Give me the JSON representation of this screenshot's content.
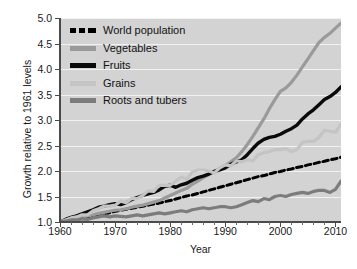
{
  "chart_data": {
    "type": "line",
    "title": "",
    "xlabel": "Year",
    "ylabel": "Growth relative to 1961 levels",
    "xlim": [
      1960,
      2011
    ],
    "ylim": [
      1.0,
      5.0
    ],
    "grid": true,
    "legend_position": "top-left",
    "xticks": [
      1960,
      1970,
      1980,
      1990,
      2000,
      2010
    ],
    "xtick_labels": [
      "1960",
      "1970",
      "1980",
      "1990",
      "2000",
      "2010"
    ],
    "yticks": [
      1.0,
      1.5,
      2.0,
      2.5,
      3.0,
      3.5,
      4.0,
      4.5,
      5.0
    ],
    "ytick_labels": [
      "1.0",
      "1.5",
      "2.0",
      "2.5",
      "3.0",
      "3.5",
      "4.0",
      "4.5",
      "5.0"
    ],
    "x": [
      1960,
      1961,
      1962,
      1963,
      1964,
      1965,
      1966,
      1967,
      1968,
      1969,
      1970,
      1971,
      1972,
      1973,
      1974,
      1975,
      1976,
      1977,
      1978,
      1979,
      1980,
      1981,
      1982,
      1983,
      1984,
      1985,
      1986,
      1987,
      1988,
      1989,
      1990,
      1991,
      1992,
      1993,
      1994,
      1995,
      1996,
      1997,
      1998,
      1999,
      2000,
      2001,
      2002,
      2003,
      2004,
      2005,
      2006,
      2007,
      2008,
      2009,
      2010,
      2011
    ],
    "series": [
      {
        "name": "World population",
        "color": "#000000",
        "style": "dashed",
        "width": 3.0,
        "values": [
          1.0,
          1.02,
          1.04,
          1.06,
          1.08,
          1.1,
          1.12,
          1.14,
          1.16,
          1.18,
          1.21,
          1.23,
          1.25,
          1.27,
          1.29,
          1.31,
          1.33,
          1.35,
          1.37,
          1.4,
          1.42,
          1.45,
          1.48,
          1.51,
          1.53,
          1.56,
          1.59,
          1.62,
          1.65,
          1.68,
          1.71,
          1.74,
          1.77,
          1.8,
          1.83,
          1.86,
          1.89,
          1.91,
          1.94,
          1.97,
          1.99,
          2.02,
          2.04,
          2.07,
          2.09,
          2.12,
          2.14,
          2.17,
          2.19,
          2.22,
          2.24,
          2.27
        ]
      },
      {
        "name": "Vegetables",
        "color": "#9a9a9a",
        "style": "solid",
        "width": 3.2,
        "values": [
          1.0,
          1.02,
          1.05,
          1.07,
          1.1,
          1.12,
          1.14,
          1.17,
          1.19,
          1.21,
          1.23,
          1.24,
          1.26,
          1.29,
          1.31,
          1.33,
          1.36,
          1.39,
          1.42,
          1.47,
          1.52,
          1.57,
          1.62,
          1.66,
          1.74,
          1.8,
          1.87,
          1.93,
          1.99,
          2.05,
          2.11,
          2.18,
          2.26,
          2.38,
          2.52,
          2.68,
          2.85,
          3.02,
          3.22,
          3.4,
          3.56,
          3.63,
          3.74,
          3.88,
          4.04,
          4.2,
          4.36,
          4.52,
          4.62,
          4.7,
          4.8,
          4.9
        ]
      },
      {
        "name": "Fruits",
        "color": "#0a0a0a",
        "style": "solid",
        "width": 3.4,
        "values": [
          1.0,
          1.05,
          1.09,
          1.12,
          1.16,
          1.2,
          1.24,
          1.29,
          1.31,
          1.34,
          1.36,
          1.34,
          1.38,
          1.44,
          1.48,
          1.52,
          1.55,
          1.58,
          1.63,
          1.7,
          1.72,
          1.68,
          1.73,
          1.76,
          1.82,
          1.87,
          1.9,
          1.94,
          1.99,
          2.02,
          2.06,
          2.13,
          2.18,
          2.22,
          2.32,
          2.44,
          2.55,
          2.62,
          2.66,
          2.68,
          2.72,
          2.78,
          2.83,
          2.9,
          3.02,
          3.12,
          3.2,
          3.3,
          3.4,
          3.46,
          3.54,
          3.65
        ]
      },
      {
        "name": "Grains",
        "color": "#c4c4c4",
        "style": "solid",
        "width": 3.2,
        "values": [
          1.0,
          1.04,
          1.08,
          1.1,
          1.14,
          1.14,
          1.22,
          1.26,
          1.31,
          1.31,
          1.33,
          1.41,
          1.38,
          1.46,
          1.46,
          1.52,
          1.61,
          1.6,
          1.72,
          1.72,
          1.72,
          1.8,
          1.88,
          1.84,
          1.98,
          2.02,
          2.02,
          2.0,
          1.96,
          2.06,
          2.12,
          2.1,
          2.2,
          2.18,
          2.22,
          2.2,
          2.32,
          2.36,
          2.38,
          2.42,
          2.42,
          2.44,
          2.38,
          2.42,
          2.56,
          2.58,
          2.58,
          2.66,
          2.8,
          2.78,
          2.76,
          2.92
        ]
      },
      {
        "name": "Roots and tubers",
        "color": "#7c7c7c",
        "style": "solid",
        "width": 3.2,
        "values": [
          1.0,
          1.02,
          1.04,
          1.04,
          1.06,
          1.05,
          1.08,
          1.1,
          1.12,
          1.1,
          1.12,
          1.11,
          1.1,
          1.12,
          1.14,
          1.12,
          1.14,
          1.16,
          1.18,
          1.16,
          1.18,
          1.2,
          1.22,
          1.2,
          1.24,
          1.26,
          1.28,
          1.26,
          1.28,
          1.3,
          1.3,
          1.28,
          1.3,
          1.34,
          1.38,
          1.42,
          1.4,
          1.46,
          1.44,
          1.5,
          1.52,
          1.5,
          1.54,
          1.56,
          1.58,
          1.56,
          1.6,
          1.62,
          1.62,
          1.58,
          1.64,
          1.8
        ]
      }
    ]
  },
  "legend": {
    "items": [
      {
        "label": "World population",
        "swatch": "dashed-black"
      },
      {
        "label": "Vegetables",
        "swatch": "gray-medium"
      },
      {
        "label": "Fruits",
        "swatch": "black"
      },
      {
        "label": "Grains",
        "swatch": "gray-light"
      },
      {
        "label": "Roots and tubers",
        "swatch": "gray-dark"
      }
    ]
  },
  "axes": {
    "x_title": "Year",
    "y_title": "Growth relative to 1961 levels"
  },
  "colors": {
    "plot_background": "#d3d3d3",
    "gridline": "#f2f2f2",
    "axis": "#4a4a4a",
    "page_background": "#ffffff"
  }
}
